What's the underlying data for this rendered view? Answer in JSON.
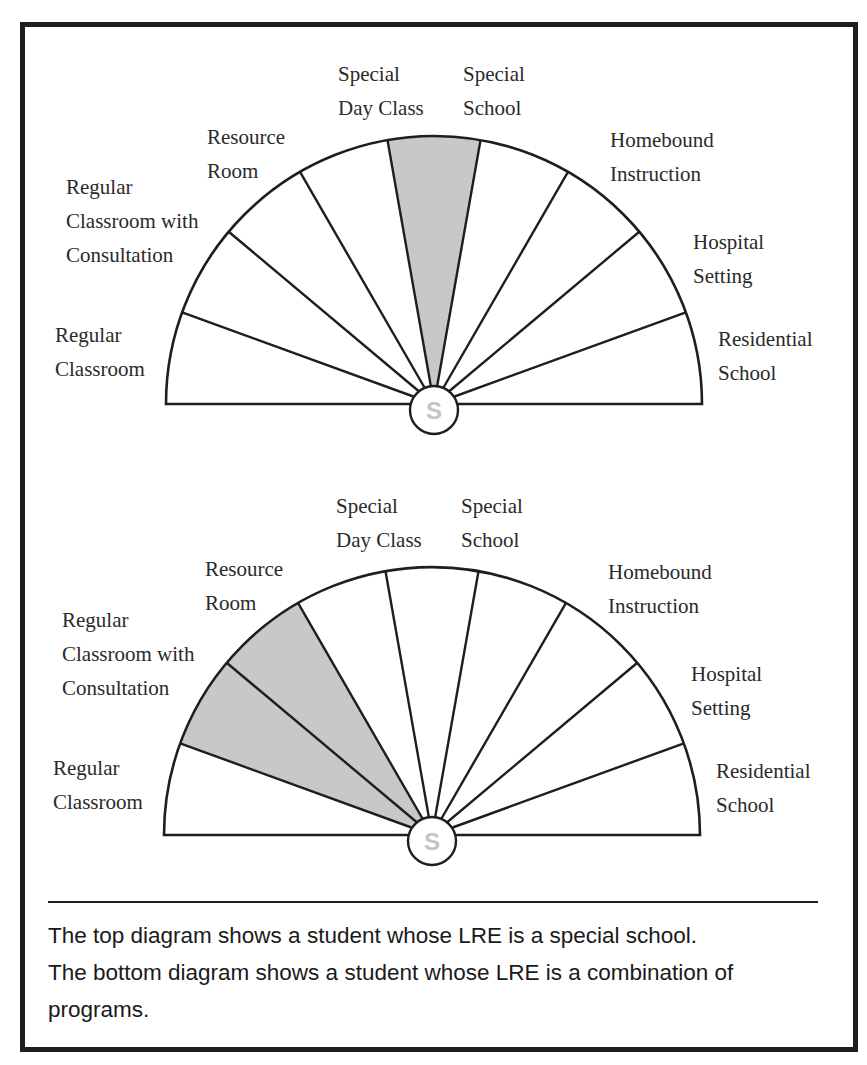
{
  "diagrams": [
    {
      "id": "top",
      "center_label": "S",
      "shaded_segments": [
        "Special School"
      ],
      "segments": [
        {
          "label": "Regular Classroom",
          "lines": [
            "Regular",
            "Classroom"
          ],
          "shaded": false
        },
        {
          "label": "Regular Classroom with Consultation",
          "lines": [
            "Regular",
            "Classroom with",
            "Consultation"
          ],
          "shaded": false
        },
        {
          "label": "Resource Room",
          "lines": [
            "Resource",
            "Room"
          ],
          "shaded": false
        },
        {
          "label": "Special Day Class",
          "lines": [
            "Special",
            "Day Class"
          ],
          "shaded": false
        },
        {
          "label": "Special School",
          "lines": [
            "Special",
            "School"
          ],
          "shaded": true
        },
        {
          "label": "Homebound Instruction",
          "lines": [
            "Homebound",
            "Instruction"
          ],
          "shaded": false
        },
        {
          "label": "Hospital Setting",
          "lines": [
            "Hospital",
            "Setting"
          ],
          "shaded": false
        },
        {
          "label": "Residential School",
          "lines": [
            "Residential",
            "School"
          ],
          "shaded": false
        }
      ]
    },
    {
      "id": "bottom",
      "center_label": "S",
      "shaded_segments": [
        "Regular Classroom with Consultation",
        "Resource Room"
      ],
      "segments": [
        {
          "label": "Regular Classroom",
          "lines": [
            "Regular",
            "Classroom"
          ],
          "shaded": false
        },
        {
          "label": "Regular Classroom with Consultation",
          "lines": [
            "Regular",
            "Classroom with",
            "Consultation"
          ],
          "shaded": true
        },
        {
          "label": "Resource Room",
          "lines": [
            "Resource",
            "Room"
          ],
          "shaded": true
        },
        {
          "label": "Special Day Class",
          "lines": [
            "Special",
            "Day Class"
          ],
          "shaded": false
        },
        {
          "label": "Special School",
          "lines": [
            "Special",
            "School"
          ],
          "shaded": false
        },
        {
          "label": "Homebound Instruction",
          "lines": [
            "Homebound",
            "Instruction"
          ],
          "shaded": false
        },
        {
          "label": "Hospital Setting",
          "lines": [
            "Hospital",
            "Setting"
          ],
          "shaded": false
        },
        {
          "label": "Residential School",
          "lines": [
            "Residential",
            "School"
          ],
          "shaded": false
        }
      ]
    }
  ],
  "labels": {
    "top": {
      "regular_classroom": "Regular\nClassroom",
      "regular_classroom_consultation": "Regular\nClassroom with\nConsultation",
      "resource_room": "Resource\nRoom",
      "special_day_class": "Special\nDay Class",
      "special_school": "Special\nSchool",
      "homebound_instruction": "Homebound\nInstruction",
      "hospital_setting": "Hospital\nSetting",
      "residential_school": "Residential\nSchool",
      "center": "S"
    },
    "bottom": {
      "regular_classroom": "Regular\nClassroom",
      "regular_classroom_consultation": "Regular\nClassroom with\nConsultation",
      "resource_room": "Resource\nRoom",
      "special_day_class": "Special\nDay Class",
      "special_school": "Special\nSchool",
      "homebound_instruction": "Homebound\nInstruction",
      "hospital_setting": "Hospital\nSetting",
      "residential_school": "Residential\nSchool",
      "center": "S"
    }
  },
  "caption": {
    "line1": "The top diagram shows a student whose LRE is a special school.",
    "line2": "The bottom diagram shows a student whose LRE is a combination of programs."
  },
  "colors": {
    "shade": "#c8c8c8",
    "stroke": "#1e1e1e",
    "center_text": "#c4c4c4"
  }
}
